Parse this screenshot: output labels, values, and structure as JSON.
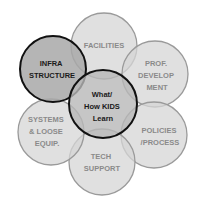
{
  "diagram": {
    "center": {
      "lines": [
        "What/",
        "How KIDS",
        "Learn"
      ]
    },
    "petals": [
      {
        "name": "facilities",
        "lines": [
          "FACILITIES"
        ]
      },
      {
        "name": "prof-development",
        "lines": [
          "PROF.",
          "DEVELOP",
          "MENT"
        ]
      },
      {
        "name": "policies-process",
        "lines": [
          "POLICIES",
          "/PROCESS"
        ]
      },
      {
        "name": "tech-support",
        "lines": [
          "TECH",
          "SUPPORT"
        ]
      },
      {
        "name": "systems-loose-equip",
        "lines": [
          "SYSTEMS",
          "& LOOSE",
          "EQUIP."
        ]
      },
      {
        "name": "infrastructure",
        "lines": [
          "INFRA",
          "STRUCTURE"
        ]
      }
    ]
  }
}
